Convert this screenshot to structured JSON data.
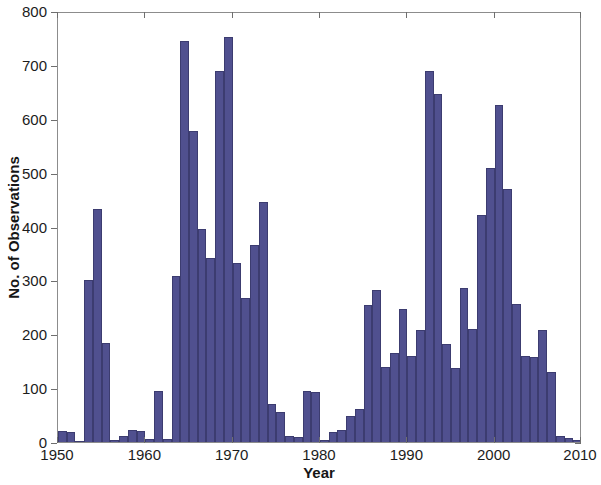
{
  "chart_data": {
    "type": "bar",
    "title": "",
    "xlabel": "Year",
    "ylabel": "No. of Observations",
    "xlim": [
      1950,
      2010
    ],
    "ylim": [
      0,
      800
    ],
    "xticks": [
      1950,
      1960,
      1970,
      1980,
      1990,
      2000,
      2010
    ],
    "yticks": [
      0,
      100,
      200,
      300,
      400,
      500,
      600,
      700,
      800
    ],
    "grid": false,
    "legend": null,
    "bar_color": "#50508f",
    "bar_edge_color": "#3c3c70",
    "axis_color": "#8c8c8c",
    "bin_width_years": 1,
    "categories": [
      1950,
      1951,
      1952,
      1953,
      1954,
      1955,
      1956,
      1957,
      1958,
      1959,
      1960,
      1961,
      1962,
      1963,
      1964,
      1965,
      1966,
      1967,
      1968,
      1969,
      1970,
      1971,
      1972,
      1973,
      1974,
      1975,
      1976,
      1977,
      1978,
      1979,
      1980,
      1981,
      1982,
      1983,
      1984,
      1985,
      1986,
      1987,
      1988,
      1989,
      1990,
      1991,
      1992,
      1993,
      1994,
      1995,
      1996,
      1997,
      1998,
      1999,
      2000,
      2001,
      2002,
      2003,
      2004,
      2005,
      2006,
      2007,
      2008,
      2009
    ],
    "values": [
      20,
      18,
      2,
      300,
      433,
      183,
      3,
      12,
      22,
      20,
      5,
      95,
      6,
      308,
      745,
      577,
      395,
      342,
      688,
      752,
      332,
      268,
      365,
      445,
      70,
      56,
      12,
      10,
      95,
      92,
      4,
      18,
      22,
      48,
      62,
      255,
      282,
      140,
      165,
      247,
      160,
      207,
      688,
      646,
      182,
      137,
      285,
      210,
      422,
      508,
      625,
      470,
      257,
      160,
      158,
      208,
      130,
      12,
      8,
      4
    ],
    "series_name": "No. of Observations"
  },
  "axis": {
    "y_tick_labels": [
      "0",
      "100",
      "200",
      "300",
      "400",
      "500",
      "600",
      "700",
      "800"
    ],
    "x_tick_labels": [
      "1950",
      "1960",
      "1970",
      "1980",
      "1990",
      "2000",
      "2010"
    ]
  }
}
